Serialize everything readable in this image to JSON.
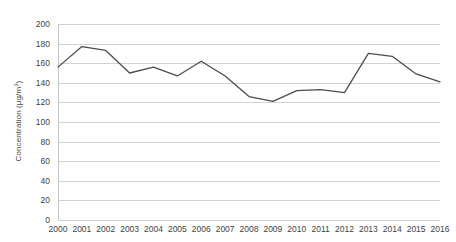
{
  "chart_data": {
    "type": "line",
    "title": "",
    "xlabel": "",
    "ylabel": "Concentration (μg/m³)",
    "ylabel_base": "Concentration (μg/m",
    "ylabel_sup": "3",
    "ylabel_close": ")",
    "categories": [
      "2000",
      "2001",
      "2002",
      "2003",
      "2004",
      "2005",
      "2006",
      "2007",
      "2008",
      "2009",
      "2010",
      "2011",
      "2012",
      "2013",
      "2014",
      "2015",
      "2016"
    ],
    "values": [
      156,
      177,
      173,
      150,
      156,
      147,
      162,
      147,
      126,
      121,
      132,
      133,
      130,
      170,
      167,
      149,
      141
    ],
    "yticks": [
      0,
      20,
      40,
      60,
      80,
      100,
      120,
      140,
      160,
      180,
      200
    ],
    "ylim": [
      0,
      200
    ],
    "grid": true,
    "legend": "none",
    "series_color": "#4d4d4d",
    "grid_color": "#d2d2d2",
    "axis_color": "#c4c4c4"
  }
}
